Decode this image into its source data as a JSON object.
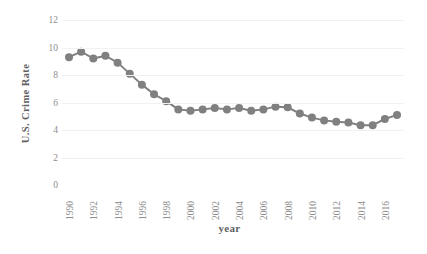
{
  "chart_data": {
    "type": "line",
    "title": "",
    "xlabel": "year",
    "ylabel": "U.S. Crime Rate",
    "x": [
      1990,
      1991,
      1992,
      1993,
      1994,
      1995,
      1996,
      1997,
      1998,
      1999,
      2000,
      2001,
      2002,
      2003,
      2004,
      2005,
      2006,
      2007,
      2008,
      2009,
      2010,
      2011,
      2012,
      2013,
      2014,
      2015,
      2016,
      2017
    ],
    "values": [
      9.3,
      9.7,
      9.2,
      9.4,
      8.9,
      8.1,
      7.3,
      6.6,
      6.1,
      5.5,
      5.4,
      5.5,
      5.6,
      5.5,
      5.6,
      5.4,
      5.5,
      5.7,
      5.65,
      5.2,
      4.9,
      4.7,
      4.6,
      4.55,
      4.35,
      4.35,
      4.8,
      5.2
    ],
    "last_value": 5.1,
    "xlim": [
      1990,
      2017
    ],
    "ylim": [
      0,
      12
    ],
    "yticks": [
      0,
      2,
      4,
      6,
      8,
      10,
      12
    ],
    "xticks": [
      1990,
      1992,
      1994,
      1996,
      1998,
      2000,
      2002,
      2004,
      2006,
      2008,
      2010,
      2012,
      2014,
      2016
    ],
    "grid": true,
    "legend": "none",
    "series_color": "#808080",
    "marker": "circle",
    "marker_size": 4,
    "line_width": 2
  },
  "axes": {
    "y_title": "U.S. Crime Rate",
    "x_title": "year",
    "y_tick_labels": [
      "12",
      "10",
      "8",
      "6",
      "4",
      "2",
      "0"
    ],
    "x_tick_labels": [
      "1990",
      "1992",
      "1994",
      "1996",
      "1998",
      "2000",
      "2002",
      "2004",
      "2006",
      "2008",
      "2010",
      "2012",
      "2014",
      "2016"
    ]
  },
  "colors": {
    "series": "#808080",
    "grid": "#f1f1f1",
    "tick_text": "#8d8d8d",
    "title_text": "#5f5f5f",
    "background": "#ffffff"
  }
}
